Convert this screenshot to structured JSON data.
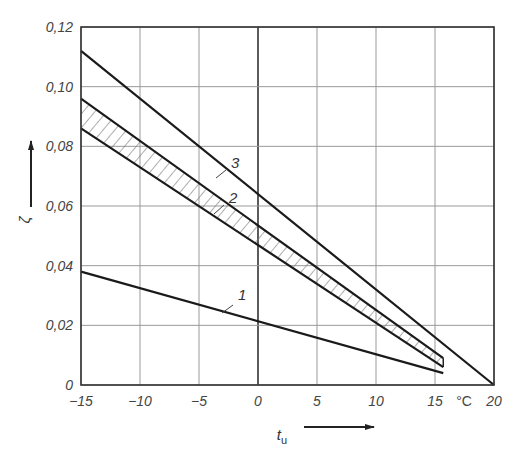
{
  "chart_data": {
    "type": "line",
    "title": "",
    "xlabel": "t_u",
    "xlabel_main": "t",
    "xlabel_sub": "u",
    "x_unit": "°C",
    "ylabel": "ζ",
    "xlim": [
      -15,
      20
    ],
    "ylim": [
      0,
      0.12
    ],
    "grid": true,
    "x_ticks": [
      -15,
      -10,
      -5,
      0,
      5,
      10,
      15,
      20
    ],
    "x_tick_labels": [
      "−15",
      "−10",
      "−5",
      "0",
      "5",
      "10",
      "15",
      "20"
    ],
    "y_ticks": [
      0,
      0.02,
      0.04,
      0.06,
      0.08,
      0.1,
      0.12
    ],
    "y_tick_labels": [
      "0",
      "0,02",
      "0,04",
      "0,06",
      "0,08",
      "0,10",
      "0,12"
    ],
    "series": [
      {
        "name": "1",
        "label": "1",
        "x": [
          -15,
          15.7
        ],
        "values": [
          0.038,
          0.004
        ]
      },
      {
        "name": "2 (upper bound)",
        "label": "2",
        "x": [
          -15,
          15.7
        ],
        "values": [
          0.096,
          0.009
        ]
      },
      {
        "name": "2 (lower bound)",
        "label": "",
        "x": [
          -15,
          15.7
        ],
        "values": [
          0.086,
          0.006
        ]
      },
      {
        "name": "3",
        "label": "3",
        "x": [
          -15,
          20
        ],
        "values": [
          0.112,
          0.0
        ]
      }
    ],
    "annotations": [
      {
        "text": "1",
        "near_series": "1",
        "at_x": -1.5,
        "at_y": 0.027
      },
      {
        "text": "2",
        "near_series": "2",
        "at_x": -2.5,
        "at_y": 0.064
      },
      {
        "text": "3",
        "near_series": "3",
        "at_x": -2.5,
        "at_y": 0.077
      }
    ],
    "hatched_band": {
      "between": [
        "2 (upper bound)",
        "2 (lower bound)"
      ],
      "pattern": "diagonal"
    },
    "legend": "none"
  }
}
